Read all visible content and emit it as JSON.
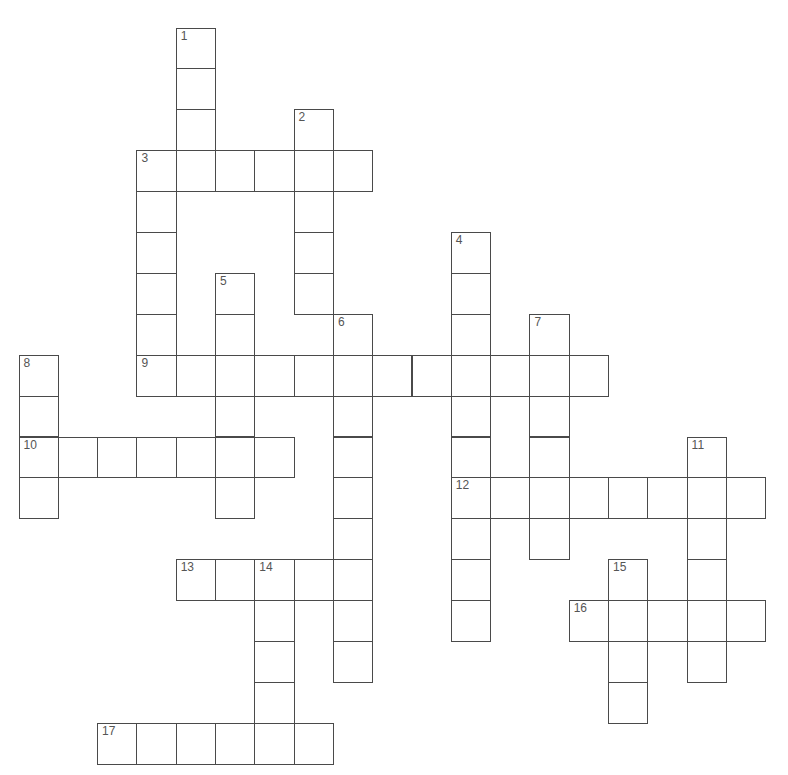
{
  "puzzle": {
    "grid_origin": {
      "x": 19,
      "y": 28
    },
    "cell_size": {
      "w": 39.3,
      "h": 40.9
    },
    "colors": {
      "border": "#4a4a4a",
      "number": "#555555",
      "cell": "#ffffff"
    },
    "words": [
      {
        "number": "1",
        "direction": "down",
        "row": 0,
        "col": 4,
        "length": 4
      },
      {
        "number": "2",
        "direction": "down",
        "row": 2,
        "col": 7,
        "length": 5
      },
      {
        "number": "3",
        "direction": "across",
        "row": 3,
        "col": 3,
        "length": 6
      },
      {
        "number": "3",
        "direction": "down",
        "row": 3,
        "col": 3,
        "length": 6
      },
      {
        "number": "4",
        "direction": "down",
        "row": 5,
        "col": 11,
        "length": 10
      },
      {
        "number": "5",
        "direction": "down",
        "row": 6,
        "col": 5,
        "length": 6
      },
      {
        "number": "6",
        "direction": "down",
        "row": 7,
        "col": 8,
        "length": 9
      },
      {
        "number": "7",
        "direction": "down",
        "row": 7,
        "col": 13,
        "length": 6
      },
      {
        "number": "8",
        "direction": "down",
        "row": 8,
        "col": 0,
        "length": 4
      },
      {
        "number": "9",
        "direction": "across",
        "row": 8,
        "col": 3,
        "length": 12
      },
      {
        "number": "10",
        "direction": "across",
        "row": 10,
        "col": 0,
        "length": 7
      },
      {
        "number": "11",
        "direction": "down",
        "row": 10,
        "col": 17,
        "length": 6
      },
      {
        "number": "12",
        "direction": "across",
        "row": 11,
        "col": 11,
        "length": 8
      },
      {
        "number": "13",
        "direction": "across",
        "row": 13,
        "col": 4,
        "length": 5
      },
      {
        "number": "14",
        "direction": "down",
        "row": 13,
        "col": 6,
        "length": 5
      },
      {
        "number": "15",
        "direction": "down",
        "row": 13,
        "col": 15,
        "length": 4
      },
      {
        "number": "16",
        "direction": "across",
        "row": 14,
        "col": 14,
        "length": 5
      },
      {
        "number": "17",
        "direction": "across",
        "row": 17,
        "col": 2,
        "length": 6
      }
    ]
  }
}
